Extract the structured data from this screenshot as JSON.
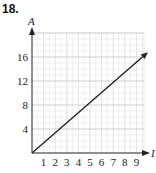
{
  "problem_number": "18.",
  "chart_data": {
    "type": "line",
    "title": "",
    "xlabel": "I",
    "ylabel": "A",
    "x_ticks": [
      "1",
      "2",
      "3",
      "4",
      "5",
      "6",
      "7",
      "8",
      "9"
    ],
    "y_ticks": [
      "4",
      "8",
      "12",
      "16"
    ],
    "xlim": [
      0,
      10
    ],
    "ylim": [
      0,
      20
    ],
    "grid": true,
    "legend": "none",
    "series": [
      {
        "name": "line",
        "x": [
          0,
          10
        ],
        "y": [
          0,
          16.8
        ],
        "arrow_end": true
      }
    ]
  }
}
